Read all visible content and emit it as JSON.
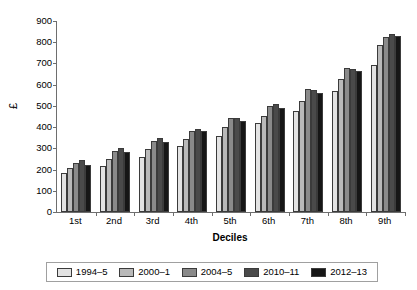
{
  "chart_data": {
    "type": "bar",
    "title": "",
    "xlabel": "Deciles",
    "ylabel": "£",
    "ylim": [
      0,
      900
    ],
    "ytick_step": 100,
    "yticks": [
      900,
      800,
      700,
      600,
      500,
      400,
      300,
      200,
      100,
      0
    ],
    "grid": false,
    "legend_position": "bottom",
    "categories": [
      "1st",
      "2nd",
      "3rd",
      "4th",
      "5th",
      "6th",
      "7th",
      "8th",
      "9th"
    ],
    "series": [
      {
        "name": "1994–5",
        "color": "#e3e3e3",
        "values": [
          182,
          218,
          261,
          311,
          358,
          418,
          474,
          570,
          694
        ]
      },
      {
        "name": "2000–1",
        "color": "#b9b9b9",
        "values": [
          208,
          252,
          299,
          344,
          401,
          454,
          525,
          626,
          788
        ]
      },
      {
        "name": "2004–5",
        "color": "#8a8a8a",
        "values": [
          233,
          288,
          335,
          384,
          443,
          501,
          578,
          678,
          825
        ]
      },
      {
        "name": "2010–11",
        "color": "#4a4a4a",
        "values": [
          243,
          300,
          347,
          392,
          444,
          508,
          577,
          676,
          838
        ]
      },
      {
        "name": "2012–13",
        "color": "#161616",
        "values": [
          222,
          285,
          331,
          382,
          430,
          490,
          561,
          664,
          831
        ]
      }
    ]
  },
  "legend": {
    "items": [
      {
        "label": "1994–5",
        "color": "#e3e3e3"
      },
      {
        "label": "2000–1",
        "color": "#b9b9b9"
      },
      {
        "label": "2004–5",
        "color": "#8a8a8a"
      },
      {
        "label": "2010–11",
        "color": "#4a4a4a"
      },
      {
        "label": "2012–13",
        "color": "#161616"
      }
    ]
  }
}
